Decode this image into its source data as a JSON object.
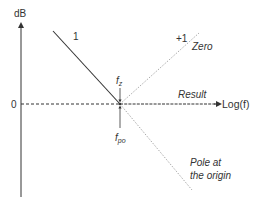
{
  "diagram": {
    "y_axis_label": "dB",
    "x_axis_label": "Log(f)",
    "zero_label": "0",
    "slope_neg_label": "1",
    "slope_pos_label": "+1",
    "zero_curve_label": "Zero",
    "result_label": "Result",
    "pole_label_line1": "Pole at",
    "pole_label_line2": "the origin",
    "fz_label_main": "f",
    "fz_label_sub": "z",
    "fpo_label_main": "f",
    "fpo_label_sub": "po"
  },
  "colors": {
    "axis": "#333333",
    "dotted": "#aaaaaa",
    "text": "#333333"
  }
}
